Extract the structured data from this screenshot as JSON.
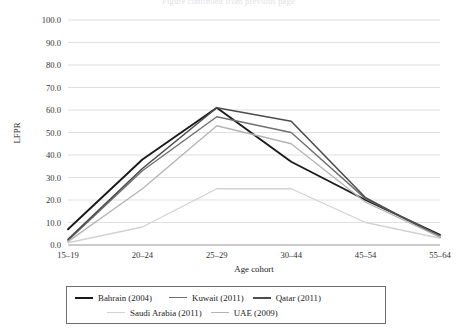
{
  "page": {
    "cropped_caption_fragment": "Figure continued from previous page"
  },
  "chart_data": {
    "type": "line",
    "title": "",
    "xlabel": "Age cohort",
    "ylabel": "LFPR",
    "categories": [
      "15–19",
      "20–24",
      "25–29",
      "30–44",
      "45–54",
      "55–64"
    ],
    "ylim": [
      0.0,
      100.0
    ],
    "ytick_labels": [
      "0.0",
      "10.0",
      "20.0",
      "30.0",
      "40.0",
      "50.0",
      "60.0",
      "70.0",
      "80.0",
      "90.0",
      "100.0"
    ],
    "yticks": [
      0,
      10,
      20,
      30,
      40,
      50,
      60,
      70,
      80,
      90,
      100
    ],
    "grid": "horizontal",
    "legend_position": "below-axes",
    "series": [
      {
        "name": "Bahrain (2004)",
        "color": "#1a1a1a",
        "width": 1.9,
        "values": [
          7.0,
          38.0,
          61.0,
          37.0,
          20.0,
          4.5
        ]
      },
      {
        "name": "Kuwait (2011)",
        "color": "#707070",
        "width": 1.4,
        "values": [
          2.0,
          33.0,
          57.0,
          50.0,
          20.5,
          4.0
        ]
      },
      {
        "name": "Qatar (2011)",
        "color": "#4d4d4d",
        "width": 1.6,
        "values": [
          2.5,
          34.0,
          61.0,
          55.0,
          21.0,
          3.5
        ]
      },
      {
        "name": "Saudi Arabia (2011)",
        "color": "#d2d2d2",
        "width": 1.3,
        "values": [
          1.0,
          8.0,
          25.0,
          25.0,
          10.0,
          3.0
        ]
      },
      {
        "name": "UAE (2009)",
        "color": "#b4b4b4",
        "width": 1.3,
        "values": [
          1.5,
          25.0,
          53.0,
          45.0,
          19.0,
          3.5
        ]
      }
    ]
  }
}
